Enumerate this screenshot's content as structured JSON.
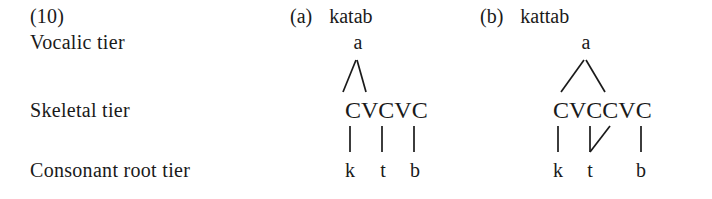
{
  "figure": {
    "example_number": "(10)",
    "tier_labels": {
      "vocalic": "Vocalic tier",
      "skeletal": "Skeletal tier",
      "consonant_root": "Consonant root tier"
    }
  },
  "derivations": [
    {
      "tag": "(a)",
      "word": "katab",
      "vocalic_tier": "a",
      "skeletal_tier": "CVCVC",
      "consonant_root_tier": [
        "k",
        "t",
        "b"
      ],
      "gemination": false
    },
    {
      "tag": "(b)",
      "word": "kattab",
      "vocalic_tier": "a",
      "skeletal_tier": "CVCCVC",
      "consonant_root_tier": [
        "k",
        "t",
        "b"
      ],
      "gemination": true
    }
  ],
  "colors": {
    "ink": "#1a1a1a",
    "background": "#ffffff"
  }
}
